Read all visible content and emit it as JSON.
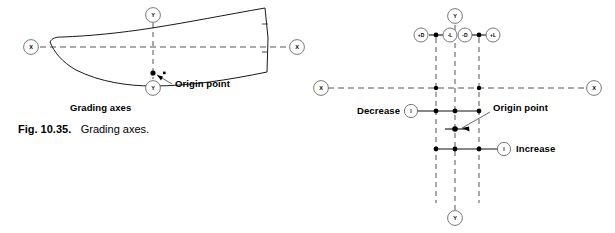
{
  "figure": {
    "caption_prefix": "Fig. 10.35.",
    "caption_text": "Grading axes."
  },
  "left_diagram": {
    "name": "grading-axes-pattern-piece",
    "subtitle": "Grading axes",
    "origin_label": "Origin point",
    "axis_nodes": {
      "x_left": "X",
      "x_right": "X",
      "y_top": "Y",
      "y_bottom": "Y"
    }
  },
  "right_diagram": {
    "name": "grading-increments-construction",
    "origin_label": "Origin point",
    "decrease_label": "Decrease",
    "increase_label": "Increase",
    "axis_nodes": {
      "x_left": "X",
      "x_right": "X",
      "y_top": "Y",
      "y_bottom": "Y"
    },
    "top_nodes": [
      {
        "id": "plus-d",
        "label": "+D"
      },
      {
        "id": "minus-l",
        "label": "-L"
      },
      {
        "id": "minus-d",
        "label": "-D"
      },
      {
        "id": "plus-l",
        "label": "+L"
      }
    ],
    "increment_nodes": [
      {
        "id": "decrease-marker",
        "label": "I"
      },
      {
        "id": "increase-marker",
        "label": "I"
      }
    ]
  },
  "colors": {
    "ink": "#1a1a1a",
    "axis": "#555555",
    "node_stroke": "#6b6b6b",
    "background": "#ffffff"
  }
}
